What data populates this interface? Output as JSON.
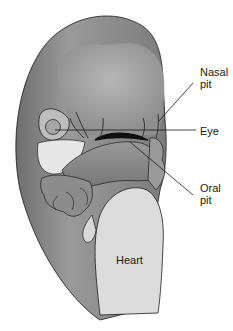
{
  "diagram": {
    "labels": [
      {
        "id": "nasal-pit",
        "text": "Nasal\npit"
      },
      {
        "id": "eye",
        "text": "Eye"
      },
      {
        "id": "oral-pit",
        "text": "Oral\npit"
      },
      {
        "id": "heart",
        "text": "Heart"
      }
    ],
    "colors": {
      "body": "#8a8a8a",
      "forehead": "#a8a8a8",
      "heart": "#dcdcdc",
      "light_region": "#e4e4e4",
      "outline": "#1a1a1a"
    }
  }
}
